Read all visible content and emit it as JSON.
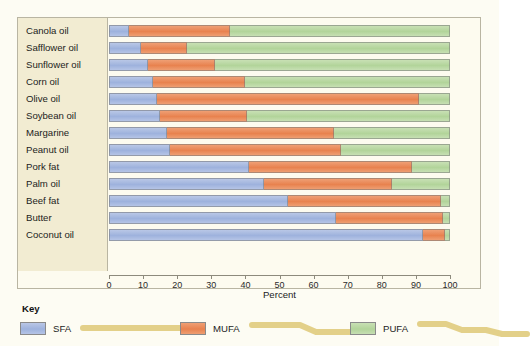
{
  "chart_data": {
    "type": "bar",
    "orientation": "horizontal",
    "stacked": true,
    "title": "",
    "xlabel": "Percent",
    "ylabel": "",
    "xlim": [
      0,
      100
    ],
    "xticks": [
      0,
      10,
      20,
      30,
      40,
      50,
      60,
      70,
      80,
      90,
      100
    ],
    "xticklabels": [
      "0",
      "10",
      "20",
      "30",
      "40",
      "50",
      "60",
      "70",
      "80",
      "90",
      "100"
    ],
    "grid": false,
    "legend_position": "bottom",
    "legend_title": "Key",
    "categories": [
      "Canola oil",
      "Safflower oil",
      "Sunflower oil",
      "Corn oil",
      "Olive oil",
      "Soybean oil",
      "Margarine",
      "Peanut oil",
      "Pork fat",
      "Palm oil",
      "Beef fat",
      "Butter",
      "Coconut oil"
    ],
    "series": [
      {
        "name": "SFA",
        "color": "#a8bbe2",
        "values": [
          6,
          9.5,
          11.5,
          13,
          14,
          15,
          17,
          18,
          41,
          45.5,
          52.5,
          66.5,
          92
        ]
      },
      {
        "name": "MUFA",
        "color": "#e8824f",
        "values": [
          29.5,
          13.5,
          19.5,
          27,
          77,
          25.5,
          49,
          50,
          48,
          37.5,
          45,
          31.5,
          6.5
        ]
      },
      {
        "name": "PUFA",
        "color": "#b2d49a",
        "values": [
          64.5,
          77,
          69,
          60,
          9,
          59.5,
          34,
          32,
          11,
          17,
          2.5,
          2,
          1.5
        ]
      }
    ]
  },
  "legend": {
    "title": "Key",
    "entries": [
      {
        "label": "SFA",
        "color": "#a8bbe2",
        "glyph": "straight-chain-icon"
      },
      {
        "label": "MUFA",
        "color": "#e8824f",
        "glyph": "one-kink-chain-icon"
      },
      {
        "label": "PUFA",
        "color": "#b2d49a",
        "glyph": "two-kink-chain-icon"
      }
    ]
  },
  "colors": {
    "page_background": "#fdfcf3",
    "plot_background": "#fdfbef",
    "label_panel": "#f2ecd2",
    "frame_border": "#b9b5a2",
    "chain_glyph": "#e8d58e",
    "sfa": "#a8bbe2",
    "mufa": "#e8824f",
    "pufa": "#b2d49a"
  }
}
